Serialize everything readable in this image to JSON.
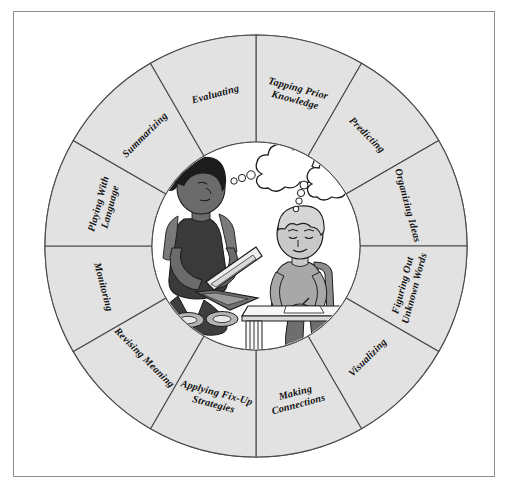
{
  "figure": {
    "type": "radial-segmented-wheel",
    "segment_count": 12
  },
  "colors": {
    "frame_border": "#8d8d8d",
    "page_background": "#ffffff",
    "ring_fill": "#e2e2e2",
    "ring_stroke": "#4a4a4a",
    "hub_fill": "#ffffff",
    "label_text": "#111111",
    "girl_skin": "#6b6b6b",
    "girl_hair": "#1c1c1c",
    "girl_shirt": "#3c3c3c",
    "boy_skin": "#c9c9c9",
    "boy_hair": "#d6d6d6",
    "boy_shirt": "#a8a8a8",
    "desk_fill": "#f2f2f2",
    "laptop_fill": "#efefef",
    "bubble_fill": "#ffffff"
  },
  "wheel": {
    "center_x": 256,
    "center_y": 246,
    "outer_radius": 211,
    "inner_radius": 104,
    "start_angle_deg": -90,
    "segments": [
      {
        "index": 0,
        "name": "tapping-prior-knowledge",
        "label": "Tapping Prior Knowledge",
        "lines": [
          "Tapping Prior",
          "Knowledge"
        ]
      },
      {
        "index": 1,
        "name": "predicting",
        "label": "Predicting",
        "lines": [
          "Predicting"
        ]
      },
      {
        "index": 2,
        "name": "organizing-ideas",
        "label": "Organizing Ideas",
        "lines": [
          "Organizing Ideas"
        ]
      },
      {
        "index": 3,
        "name": "figuring-out-unknown-words",
        "label": "Figuring Out Unknown Words",
        "lines": [
          "Figuring Out",
          "Unknown Words"
        ]
      },
      {
        "index": 4,
        "name": "visualizing",
        "label": "Visualizing",
        "lines": [
          "Visualizing"
        ]
      },
      {
        "index": 5,
        "name": "making-connections",
        "label": "Making Connections",
        "lines": [
          "Making",
          "Connections"
        ]
      },
      {
        "index": 6,
        "name": "applying-fix-up-strategies",
        "label": "Applying Fix-Up Strategies",
        "lines": [
          "Applying Fix-Up",
          "Strategies"
        ]
      },
      {
        "index": 7,
        "name": "revising-meaning",
        "label": "Revising Meaning",
        "lines": [
          "Revising Meaning"
        ]
      },
      {
        "index": 8,
        "name": "monitoring",
        "label": "Monitoring",
        "lines": [
          "Monitoring"
        ]
      },
      {
        "index": 9,
        "name": "playing-with-language",
        "label": "Playing With Language",
        "lines": [
          "Playing With",
          "Language"
        ]
      },
      {
        "index": 10,
        "name": "summarizing",
        "label": "Summarizing",
        "lines": [
          "Summarizing"
        ]
      },
      {
        "index": 11,
        "name": "evaluating",
        "label": "Evaluating",
        "lines": [
          "Evaluating"
        ]
      }
    ]
  },
  "hub_illustration": {
    "name": "two-students-reading-and-writing",
    "description": "A girl sitting cross-legged reading a laptop and a boy writing at a desk, each with a thought bubble",
    "figures": [
      {
        "name": "girl-with-laptop",
        "thought_bubble": true
      },
      {
        "name": "boy-at-desk",
        "thought_bubble": true
      }
    ]
  }
}
